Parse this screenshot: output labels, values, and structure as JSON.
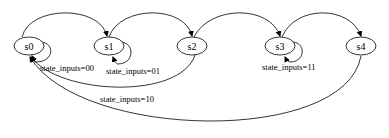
{
  "diagram": {
    "type": "state-machine",
    "nodes": [
      {
        "id": "s0",
        "label": "s0",
        "cx": 29,
        "cy": 46
      },
      {
        "id": "s1",
        "label": "s1",
        "cx": 109,
        "cy": 46
      },
      {
        "id": "s2",
        "label": "s2",
        "cx": 192,
        "cy": 46
      },
      {
        "id": "s3",
        "label": "s3",
        "cx": 280,
        "cy": 46
      },
      {
        "id": "s4",
        "label": "s4",
        "cx": 361,
        "cy": 46
      }
    ],
    "edges": [
      {
        "from": "s0",
        "to": "s0",
        "label": "state_inputs=00"
      },
      {
        "from": "s0",
        "to": "s1",
        "label": ""
      },
      {
        "from": "s1",
        "to": "s1",
        "label": "state_inputs=01"
      },
      {
        "from": "s1",
        "to": "s2",
        "label": ""
      },
      {
        "from": "s2",
        "to": "s0",
        "label": "state_inputs=10"
      },
      {
        "from": "s2",
        "to": "s3",
        "label": ""
      },
      {
        "from": "s3",
        "to": "s3",
        "label": "state_inputs=11"
      },
      {
        "from": "s3",
        "to": "s4",
        "label": ""
      },
      {
        "from": "s4",
        "to": "s0",
        "label": ""
      }
    ],
    "labels": {
      "s0": "s0",
      "s1": "s1",
      "s2": "s2",
      "s3": "s3",
      "s4": "s4",
      "loop_s0": "state_inputs=00",
      "loop_s1": "state_inputs=01",
      "edge_s2_s0": "state_inputs=10",
      "loop_s3": "state_inputs=11"
    }
  }
}
